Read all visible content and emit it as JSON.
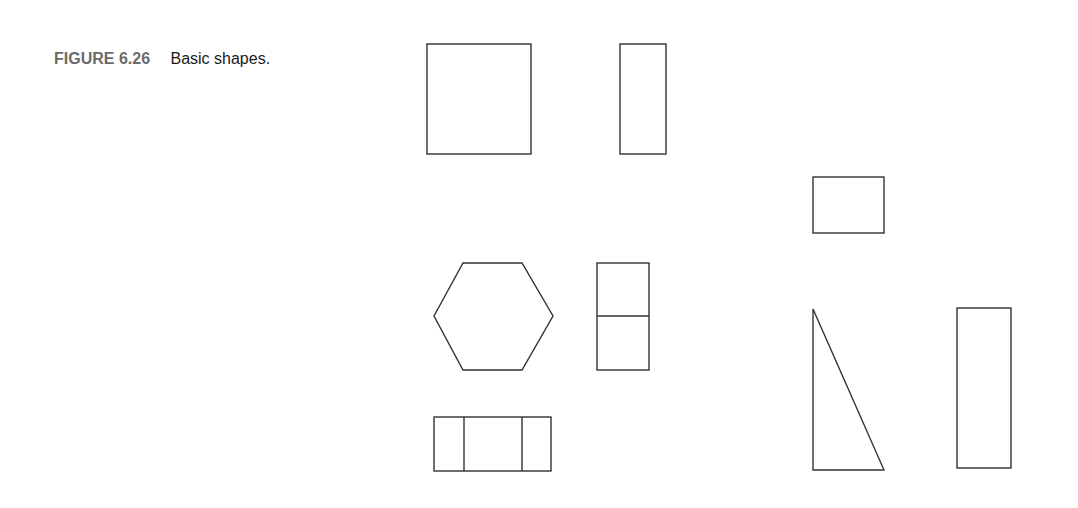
{
  "caption": {
    "label": "FIGURE 6.26",
    "title": "Basic shapes."
  },
  "colors": {
    "stroke": "#333333",
    "label": "#6b6b6b",
    "text": "#1a1a1a",
    "background": "#ffffff"
  },
  "shapes": [
    {
      "name": "square",
      "type": "rect",
      "x": 427,
      "y": 44,
      "w": 104,
      "h": 110
    },
    {
      "name": "tall-rectangle-top",
      "type": "rect",
      "x": 620,
      "y": 44,
      "w": 46,
      "h": 110
    },
    {
      "name": "small-rectangle",
      "type": "rect",
      "x": 813,
      "y": 177,
      "w": 71,
      "h": 56
    },
    {
      "name": "hexagon",
      "type": "polygon",
      "points": "434,316 463,263 522,263 553,316 522,370 463,370"
    },
    {
      "name": "split-rectangle",
      "type": "rect",
      "x": 597,
      "y": 263,
      "w": 52,
      "h": 107,
      "dividers_y": [
        316
      ]
    },
    {
      "name": "right-triangle",
      "type": "polygon",
      "points": "813,309 813,470 884,470"
    },
    {
      "name": "tall-rectangle-right",
      "type": "rect",
      "x": 957,
      "y": 308,
      "w": 54,
      "h": 160
    },
    {
      "name": "triple-rectangle",
      "type": "rect",
      "x": 434,
      "y": 417,
      "w": 117,
      "h": 54,
      "dividers_x": [
        464,
        522
      ]
    }
  ]
}
